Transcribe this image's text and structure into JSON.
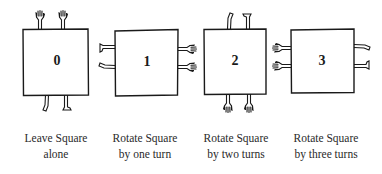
{
  "figure": {
    "squares": [
      {
        "number": "0",
        "caption_line1": "Leave Square",
        "caption_line2": "alone",
        "rotation_turns": 0,
        "hands_side": "top",
        "feet_side": "bottom"
      },
      {
        "number": "1",
        "caption_line1": "Rotate Square",
        "caption_line2": "by one turn",
        "rotation_turns": 1,
        "hands_side": "right",
        "feet_side": "left"
      },
      {
        "number": "2",
        "caption_line1": "Rotate Square",
        "caption_line2": "by two turns",
        "rotation_turns": 2,
        "hands_side": "bottom",
        "feet_side": "top"
      },
      {
        "number": "3",
        "caption_line1": "Rotate Square",
        "caption_line2": "by three turns",
        "rotation_turns": 3,
        "hands_side": "left",
        "feet_side": "right"
      }
    ]
  },
  "colors": {
    "ink": "#1a1a1a",
    "background": "#ffffff"
  }
}
